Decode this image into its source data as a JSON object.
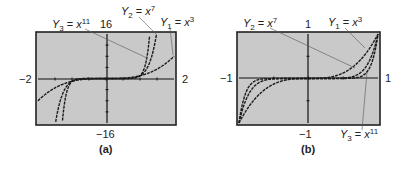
{
  "chart_data": [
    {
      "type": "line",
      "panel_label": "(a)",
      "xlim": [
        -2,
        2
      ],
      "ylim": [
        -16,
        16
      ],
      "tick_labels": {
        "xmin": "−2",
        "xmax": "2",
        "ymax": "16",
        "ymin": "−16"
      },
      "grid": false,
      "legend_position": "callout labels above plot",
      "series": [
        {
          "name": "Y1 = x^3",
          "label_var": "Y",
          "label_sub": "1",
          "label_base": "x",
          "label_exp": "3",
          "exponent": 3
        },
        {
          "name": "Y2 = x^7",
          "label_var": "Y",
          "label_sub": "2",
          "label_base": "x",
          "label_exp": "7",
          "exponent": 7
        },
        {
          "name": "Y3 = x^11",
          "label_var": "Y",
          "label_sub": "3",
          "label_base": "x",
          "label_exp": "11",
          "exponent": 11
        }
      ]
    },
    {
      "type": "line",
      "panel_label": "(b)",
      "xlim": [
        -1,
        1
      ],
      "ylim": [
        -1,
        1
      ],
      "tick_labels": {
        "xmin": "−1",
        "xmax": "1",
        "ymax": "1",
        "ymin": "−1"
      },
      "grid": false,
      "legend_position": "callout labels above and below plot",
      "series": [
        {
          "name": "Y1 = x^3",
          "label_var": "Y",
          "label_sub": "1",
          "label_base": "x",
          "label_exp": "3",
          "exponent": 3
        },
        {
          "name": "Y2 = x^7",
          "label_var": "Y",
          "label_sub": "2",
          "label_base": "x",
          "label_exp": "7",
          "exponent": 7
        },
        {
          "name": "Y3 = x^11",
          "label_var": "Y",
          "label_sub": "3",
          "label_base": "x",
          "label_exp": "11",
          "exponent": 11
        }
      ]
    }
  ],
  "style": {
    "plot_background": "#c9c9c9",
    "frame_color": "#222222",
    "curve_color": "#1a1a1a",
    "callout_color": "#555555"
  }
}
